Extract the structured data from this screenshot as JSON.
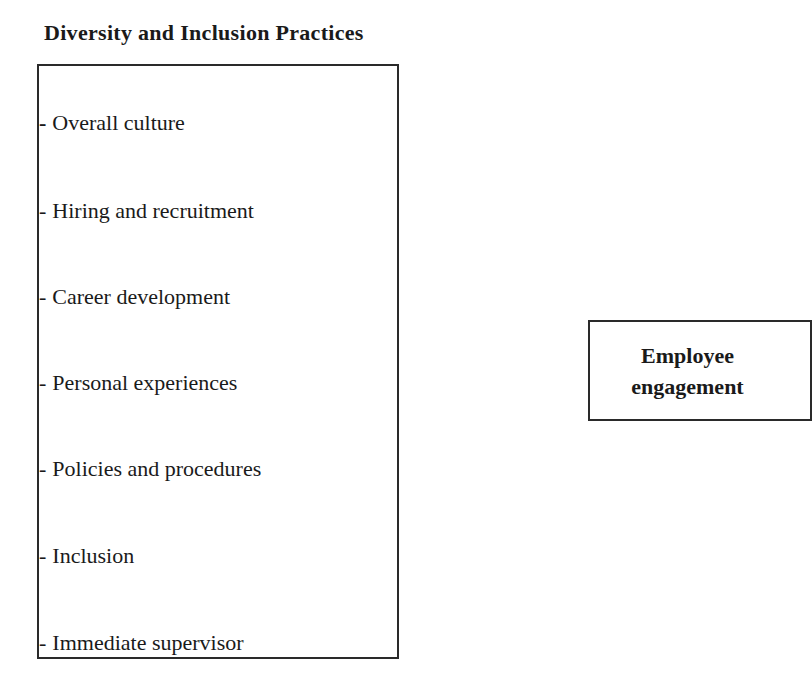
{
  "diagram": {
    "left_panel": {
      "title": "Diversity and Inclusion Practices",
      "items": [
        {
          "dash": "-",
          "label": "Overall culture"
        },
        {
          "dash": "-",
          "label": "Hiring and recruitment"
        },
        {
          "dash": "-",
          "label": "Career development"
        },
        {
          "dash": "-",
          "label": "Personal experiences"
        },
        {
          "dash": "-",
          "label": "Policies and procedures"
        },
        {
          "dash": "-",
          "label": "Inclusion"
        },
        {
          "dash": "-",
          "label": "Immediate supervisor"
        }
      ]
    },
    "right_panel": {
      "line1": "Employee",
      "line2": "engagement"
    },
    "colors": {
      "border": "#2a2a2a",
      "text": "#1a1a1a",
      "background": "#ffffff"
    }
  }
}
